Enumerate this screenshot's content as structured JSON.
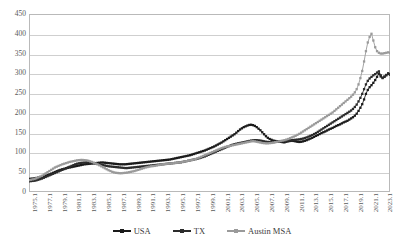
{
  "chart_data": {
    "type": "line",
    "title": "",
    "xlabel": "",
    "ylabel": "",
    "ylim": [
      0,
      450
    ],
    "ytick_step": 50,
    "grid": true,
    "legend_position": "bottom",
    "ytick_labels": [
      "450",
      "400",
      "350",
      "300",
      "250",
      "200",
      "150",
      "100",
      "50",
      "0"
    ],
    "xtick_labels": [
      "1975.1",
      "1977.1",
      "1979.1",
      "1981.1",
      "1983.1",
      "1985.1",
      "1987.1",
      "1989.1",
      "1991.1",
      "1993.1",
      "1995.1",
      "1997.1",
      "1999.1",
      "2001.1",
      "2003.1",
      "2005.1",
      "2007.1",
      "2009.1",
      "2011.1",
      "2013.1",
      "2015.1",
      "2017.1",
      "2019.1",
      "2021.1",
      "2023.1"
    ],
    "x_start": 1975.0,
    "x_end": 2023.75,
    "x_step_quarters": 0.25,
    "series": [
      {
        "name": "USA",
        "color": "#1a1a1a",
        "marker": "square",
        "values": [
          33,
          33.5,
          34,
          34.5,
          35.5,
          36.5,
          37.5,
          38.5,
          40,
          41.5,
          43,
          44.5,
          46.5,
          48.5,
          50.5,
          52.5,
          54.5,
          56,
          57.5,
          58.5,
          60,
          61,
          62,
          63,
          64,
          65,
          66,
          67,
          68,
          69,
          70,
          70.5,
          71,
          71.5,
          72,
          72.5,
          73,
          73.5,
          74,
          74.5,
          74.5,
          74,
          73.5,
          73,
          72.5,
          72,
          71.5,
          71,
          70.5,
          70,
          70,
          70,
          70,
          70.5,
          71,
          71.5,
          72,
          72.5,
          73,
          73.5,
          74,
          74.5,
          75,
          75.5,
          76,
          76.5,
          77,
          77.5,
          78,
          78.5,
          79,
          79.5,
          80,
          80.5,
          81,
          81.5,
          82,
          83,
          84,
          85,
          86,
          87,
          88,
          89,
          90,
          91,
          92,
          93,
          94.5,
          96,
          97.5,
          99,
          100.5,
          102,
          103.5,
          105,
          107,
          109,
          111,
          113,
          115,
          117.5,
          120,
          122.5,
          125,
          128,
          131,
          134,
          137,
          140,
          143,
          146,
          150,
          154,
          158,
          161,
          164,
          166,
          168,
          169.5,
          170,
          169,
          167,
          164,
          160,
          156,
          151,
          146,
          141,
          137,
          134,
          132,
          130,
          129,
          128.5,
          128,
          127,
          126,
          125.5,
          127,
          128,
          129,
          129.5,
          129,
          128,
          127,
          126.5,
          127,
          128,
          129.5,
          131,
          133,
          135,
          137,
          139.5,
          142,
          144,
          146.5,
          149,
          151,
          153,
          155.5,
          158,
          160,
          162,
          164.5,
          167,
          169,
          171,
          173.5,
          176,
          178,
          180,
          183,
          186,
          189,
          193,
          198,
          205,
          213,
          222,
          234,
          248,
          258,
          265,
          270,
          276,
          283,
          291,
          299,
          292,
          288,
          291,
          295,
          299,
          297
        ]
      },
      {
        "name": "TX",
        "color": "#2b2b2b",
        "marker": "square",
        "values": [
          27,
          27.5,
          28,
          28.5,
          29.5,
          31,
          32.5,
          34,
          36,
          38,
          40,
          42,
          44,
          46,
          48,
          50,
          52,
          54,
          56,
          58,
          60,
          62,
          64,
          66,
          68,
          70,
          71.5,
          72.5,
          73.5,
          74,
          74.5,
          75,
          75,
          74.5,
          74,
          73,
          72,
          71,
          70,
          69,
          68,
          67,
          66,
          65,
          64.5,
          64,
          63.5,
          63,
          62.5,
          62,
          61.5,
          61,
          60.5,
          60.5,
          61,
          61.5,
          62,
          62.5,
          63,
          63.5,
          64,
          64.5,
          65,
          65.5,
          66,
          66.5,
          67,
          67.5,
          68,
          68.5,
          69,
          69.5,
          70,
          70.5,
          71,
          71.5,
          72,
          72.5,
          73,
          73.5,
          74,
          74.5,
          75,
          76,
          77,
          78,
          79,
          80,
          81,
          82,
          83,
          84,
          85.5,
          87,
          88.5,
          90,
          92,
          94,
          96,
          98,
          100,
          102,
          104,
          106,
          108,
          110,
          112,
          114,
          116,
          118,
          119.5,
          121,
          122,
          123,
          124,
          125,
          126,
          127,
          128,
          129,
          130,
          130.5,
          131,
          131,
          130.5,
          130,
          129,
          128,
          127,
          126.5,
          126,
          126,
          126,
          126.5,
          127,
          127.5,
          128,
          128.5,
          129,
          129.5,
          130,
          130.5,
          131,
          131.5,
          132,
          132.5,
          133,
          134,
          135,
          136.5,
          138,
          140,
          142,
          144,
          146.5,
          149,
          152,
          155,
          158,
          161,
          164,
          167,
          170,
          173,
          176,
          179,
          182,
          185,
          188,
          191,
          194,
          197,
          200,
          203,
          206,
          210,
          215,
          221,
          229,
          238,
          248,
          260,
          272,
          281,
          287,
          291,
          295,
          298,
          302,
          305,
          295,
          289,
          292,
          296,
          300,
          297
        ]
      },
      {
        "name": "Austin MSA",
        "color": "#9a9a9a",
        "marker": "square",
        "values": [
          30,
          31,
          32,
          33,
          35,
          37,
          39,
          41,
          44,
          47,
          50,
          53,
          56,
          59,
          62,
          64,
          66,
          68,
          70,
          71.5,
          73,
          74.5,
          76,
          77,
          78,
          79,
          80,
          80.5,
          81,
          81,
          80.5,
          80,
          79,
          77.5,
          76,
          74,
          72,
          70,
          67.5,
          65,
          62.5,
          60,
          57.5,
          55,
          53,
          51,
          49.5,
          48.5,
          48,
          47.5,
          47.5,
          48,
          48.5,
          49,
          50,
          51,
          52,
          53,
          54.5,
          56,
          57.5,
          59,
          60.5,
          62,
          63,
          64,
          65,
          65.5,
          66,
          67,
          68,
          69,
          70,
          70.5,
          71,
          71.5,
          72,
          72.5,
          73,
          73.5,
          74,
          74.5,
          75,
          76,
          77,
          78,
          79,
          80,
          81,
          82,
          83.5,
          85,
          87,
          89,
          91,
          93,
          95,
          97,
          99,
          101,
          103,
          105,
          107,
          109,
          111,
          112.5,
          114,
          115,
          116,
          117,
          118,
          119,
          120,
          121,
          122,
          123,
          124,
          125,
          126,
          127,
          128,
          128.5,
          128,
          127,
          126,
          125,
          124,
          123.5,
          123,
          123,
          123.5,
          124,
          125,
          126,
          127,
          128,
          129,
          130,
          131,
          132.5,
          134,
          136,
          138,
          140,
          142,
          144.5,
          147,
          150,
          153,
          156,
          159,
          162,
          165,
          168,
          171,
          174,
          177,
          180,
          183,
          186,
          189,
          192,
          195,
          198,
          201,
          205,
          209,
          213,
          217,
          221,
          225,
          229,
          233,
          237,
          241,
          246,
          252,
          260,
          272,
          288,
          306,
          330,
          356,
          378,
          392,
          400,
          383,
          366,
          356,
          352,
          350,
          350,
          351,
          352,
          353,
          352
        ]
      }
    ]
  },
  "legend": {
    "items": [
      {
        "label": "USA"
      },
      {
        "label": "TX"
      },
      {
        "label": "Austin MSA"
      }
    ]
  }
}
